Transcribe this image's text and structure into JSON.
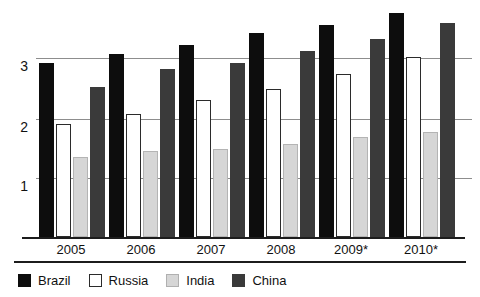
{
  "chart_data": {
    "type": "bar",
    "title": "",
    "subtitle": "",
    "xlabel": "",
    "ylabel": "",
    "categories": [
      "2005",
      "2006",
      "2007",
      "2008",
      "2009*",
      "2010*"
    ],
    "series": [
      {
        "name": "Brazil",
        "color": "#0d0d0d",
        "values": [
          2.87,
          3.03,
          3.18,
          3.37,
          3.5,
          3.7
        ]
      },
      {
        "name": "Russia",
        "color": "#ffffff",
        "values": [
          1.87,
          2.03,
          2.27,
          2.45,
          2.7,
          2.98
        ]
      },
      {
        "name": "India",
        "color": "#d6d6d6",
        "values": [
          1.32,
          1.42,
          1.45,
          1.53,
          1.65,
          1.73
        ]
      },
      {
        "name": "China",
        "color": "#3a3a3a",
        "values": [
          2.48,
          2.77,
          2.88,
          3.08,
          3.28,
          3.53
        ]
      }
    ],
    "ylim": [
      0,
      3.82
    ],
    "yticks": [
      1,
      2,
      3
    ],
    "ytick_labels": [
      "1",
      "2",
      "3"
    ],
    "grid": true,
    "legend_position": "bottom"
  },
  "axis": {
    "ytick_labels": [
      "3",
      "2",
      "1"
    ],
    "xtick_labels": [
      "2005",
      "2006",
      "2007",
      "2008",
      "2009*",
      "2010*"
    ]
  },
  "legend": {
    "items": [
      {
        "label": "Brazil",
        "swatch": "brazil-swatch"
      },
      {
        "label": "Russia",
        "swatch": "russia-swatch"
      },
      {
        "label": "India",
        "swatch": "india-swatch"
      },
      {
        "label": "China",
        "swatch": "china-swatch"
      }
    ]
  },
  "colors": {
    "brazil": "#0d0d0d",
    "russia": "#ffffff",
    "india": "#d6d6d6",
    "china": "#3a3a3a",
    "gridline": "#8d8d8d",
    "axis": "#1c1c1c",
    "text": "#111111",
    "background": "#ffffff"
  }
}
